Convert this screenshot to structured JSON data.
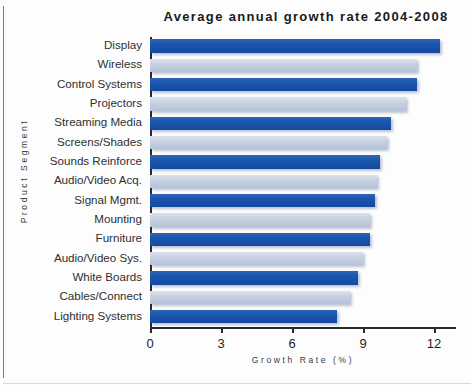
{
  "chart_data": {
    "type": "bar",
    "orientation": "horizontal",
    "title": "Average annual growth rate 2004-2008",
    "xlabel": "Growth Rate (%)",
    "ylabel": "Product Segment",
    "xlim": [
      0,
      12.9
    ],
    "xticks": [
      0,
      3,
      6,
      9,
      12
    ],
    "xtick_labels": [
      "0",
      "3",
      "6",
      "9",
      "12"
    ],
    "grid": false,
    "legend": null,
    "categories": [
      "Display",
      "Wireless",
      "Control Systems",
      "Projectors",
      "Streaming Media",
      "Screens/Shades",
      "Sounds Reinforce",
      "Audio/Video Acq.",
      "Signal Mgmt.",
      "Mounting",
      "Furniture",
      "Audio/Video Sys.",
      "White Boards",
      "Cables/Connect",
      "Lighting Systems"
    ],
    "values": [
      12.25,
      11.3,
      11.3,
      10.8,
      10.2,
      10.0,
      9.7,
      9.6,
      9.5,
      9.3,
      9.3,
      9.0,
      8.8,
      8.45,
      7.9
    ],
    "bar_styles": [
      "dark",
      "light",
      "dark",
      "light",
      "dark",
      "light",
      "dark",
      "light",
      "dark",
      "light",
      "dark",
      "light",
      "dark",
      "light",
      "dark"
    ],
    "colors": {
      "bar_dark": "#1a55ae",
      "bar_light": "#c6d0e2",
      "axis": "#2b2b2b",
      "text": "#2f2f2f",
      "background": "#fdfdfd"
    }
  }
}
